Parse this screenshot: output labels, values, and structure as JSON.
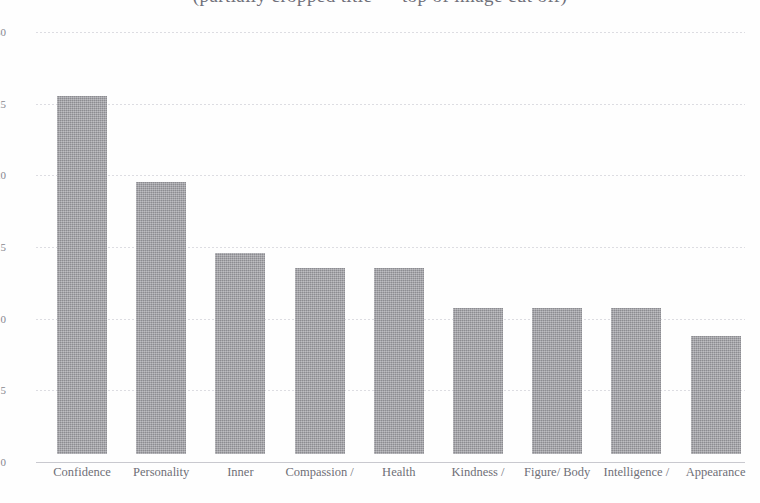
{
  "chart_data": {
    "type": "bar",
    "title": "(partially cropped title — top of image cut off)",
    "title_visible_fragment": ")",
    "xlabel": "",
    "ylabel": "",
    "ylim": [
      0,
      30
    ],
    "yticks": [
      0,
      5,
      10,
      15,
      20,
      25,
      30
    ],
    "ytick_labels": [
      "0",
      "5",
      "10",
      "15",
      "20",
      "25",
      "30"
    ],
    "grid": true,
    "legend": "none",
    "orientation": "vertical",
    "categories": [
      "Confidence",
      "Personality",
      "Inner",
      "Compassion /",
      "Health",
      "Kindness /",
      "Figure/ Body",
      "Intelligence /",
      "Appearance"
    ],
    "values": [
      25,
      19,
      14,
      13,
      13,
      10.2,
      10.2,
      10.2,
      8.2
    ],
    "bar_color": "#9c9ca1",
    "gridline_color": "#d7d7dd",
    "axis_color": "#c9c9cf",
    "text_color": "#6f6f77"
  }
}
